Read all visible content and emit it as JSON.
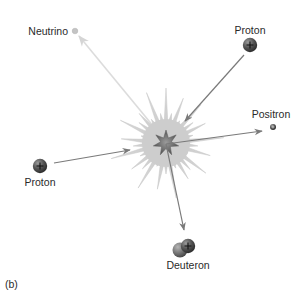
{
  "figure": {
    "panel_label": "(b)"
  },
  "colors": {
    "burst": "#cfcfcf",
    "burst_edge": "#bdbdbd",
    "core_star": "#6e6e6e",
    "arrow": "#7a7a7a",
    "neutrino_arrow": "#d9d9d9",
    "particle_dark": "#4a4a4a",
    "text": "#2a2a2a"
  },
  "particles": {
    "neutrino": {
      "label": "Neutrino",
      "x": 75,
      "y": 31,
      "r": 2.8
    },
    "proton_top": {
      "label": "Proton",
      "x": 250,
      "y": 45,
      "r": 7,
      "symbol": "+"
    },
    "positron": {
      "label": "Positron",
      "x": 273,
      "y": 127,
      "r": 3,
      "symbol": "+"
    },
    "proton_left": {
      "label": "Proton",
      "x": 40,
      "y": 166,
      "r": 7,
      "symbol": "+"
    },
    "deuteron": {
      "label": "Deuteron",
      "x": 184,
      "y": 247,
      "symbol": "+"
    }
  },
  "center": {
    "x": 166,
    "y": 143
  },
  "arrows": [
    {
      "name": "proton-top-incoming",
      "from": "proton_top",
      "to": "center"
    },
    {
      "name": "proton-left-incoming",
      "from": "proton_left",
      "to": "center"
    },
    {
      "name": "positron-outgoing",
      "from": "center",
      "to": "positron"
    },
    {
      "name": "deuteron-outgoing",
      "from": "center",
      "to": "deuteron"
    },
    {
      "name": "neutrino-outgoing",
      "from": "center",
      "to": "neutrino"
    }
  ]
}
